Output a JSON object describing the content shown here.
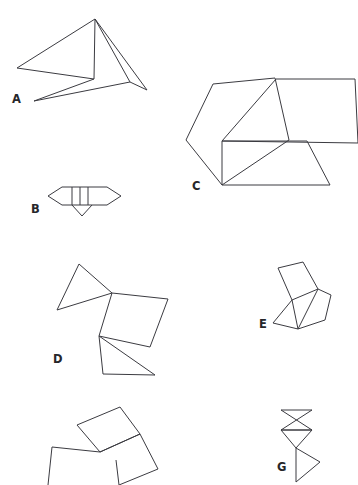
{
  "page": {
    "background_color": "#ffffff",
    "width": 358,
    "height": 485,
    "stroke_color": "#3b3b41",
    "label_color": "#26262a",
    "stroke_width": 1
  },
  "figures": [
    {
      "id": "A",
      "label": "A",
      "label_x": 12,
      "label_y": 103,
      "description": "arrow-like concave polygon with crossing interior lines",
      "paths": [
        "M 95,19 L 17,68 L 94,79 L 34,101 L 130,82 L 147,90 L 95,19",
        "M 95,19 L 94,79",
        "M 95,19 L 130,82"
      ]
    },
    {
      "id": "B",
      "label": "B",
      "label_x": 31,
      "label_y": 213,
      "description": "elongated hexagon with three vertical inner lines and a triangular flap below",
      "paths": [
        "M 48,196 L 62,187 L 107,187 L 121,196 L 107,205 L 62,205 L 48,196",
        "M 72,187 L 72,205",
        "M 80,187 L 80,205",
        "M 88,187 L 88,205",
        "M 72,205 L 82,216 L 92,205"
      ]
    },
    {
      "id": "C",
      "label": "C",
      "label_x": 192,
      "label_y": 190,
      "description": "three overlapping trapezoids forming a hexagon-like cluster",
      "paths": [
        "M 213,84 L 275,78 L 289,140 L 222,185 L 186,140 L 213,84",
        "M 276,79 L 355,79 L 358,143 L 222,141 L 276,79",
        "M 222,141 L 307,141 L 330,185 L 222,185 L 222,141"
      ]
    },
    {
      "id": "D",
      "label": "D",
      "label_x": 53,
      "label_y": 363,
      "description": "triangle overlapping a parallelogram and an inverted triangle",
      "paths": [
        "M 79,264 L 112,293 L 57,310 L 79,264",
        "M 112,293 L 168,299 L 150,347 L 99,336 L 112,293",
        "M 99,336 L 155,375 L 103,374 L 99,336"
      ]
    },
    {
      "id": "E",
      "label": "E",
      "label_x": 259,
      "label_y": 328,
      "description": "two tilted quadrilaterals sharing a vertex with a small triangle",
      "paths": [
        "M 278,268 L 303,262 L 318,289 L 292,300 L 278,268",
        "M 318,289 L 331,295 L 325,320 L 298,329 L 318,289",
        "M 292,300 L 298,329 L 273,323 L 292,300"
      ]
    },
    {
      "id": "F",
      "label": "",
      "label_x": 0,
      "label_y": 0,
      "description": "tilted squares chain cropped by the bottom edge of the page",
      "paths": [
        "M 77,425 L 120,407 L 140,434 L 100,452 L 77,425",
        "M 100,452 L 140,434 L 158,469 L 119,485",
        "M 100,452 L 52,447 L 48,485",
        "M 119,485 L 116,460"
      ]
    },
    {
      "id": "G",
      "label": "G",
      "label_x": 277,
      "label_y": 471,
      "description": "two stacked bow-tie triangles above a right triangle flag",
      "paths": [
        "M 281,410 L 312,410 L 281,430 L 312,430 L 281,410",
        "M 281,430 L 312,430 L 296,448 L 281,430",
        "M 296,448 L 296,482 L 320,462 L 296,448"
      ]
    }
  ]
}
